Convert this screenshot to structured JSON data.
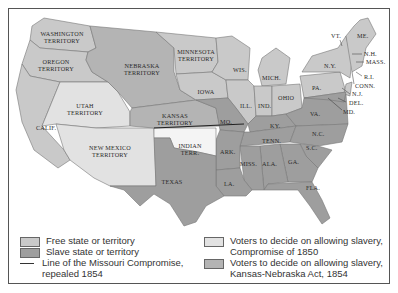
{
  "map": {
    "colors": {
      "free": "#c9c9c9",
      "slave": "#9e9e9e",
      "compromise_1850": "#e2e2e2",
      "kansas_nebraska": "#b4b4b4",
      "indian": "#f4f4f4",
      "water": "#ffffff",
      "missouri_line": "#222222"
    },
    "labels": {
      "washington": [
        "WASHINGTON",
        "TERRITORY"
      ],
      "oregon": [
        "OREGON",
        "TERRITORY"
      ],
      "nebraska": [
        "NEBRASKA",
        "TERRITORY"
      ],
      "minnesota": [
        "MINNESOTA",
        "TERRITORY"
      ],
      "utah": [
        "UTAH",
        "TERRITORY"
      ],
      "kansas": [
        "KANSAS",
        "TERRITORY"
      ],
      "new_mexico": [
        "NEW MEXICO",
        "TERRITORY"
      ],
      "indian": [
        "INDIAN",
        "TERR."
      ],
      "calif": "CALIF.",
      "texas": "TEXAS",
      "wis": "WIS.",
      "mich": "MICH.",
      "iowa": "IOWA",
      "ill": "ILL.",
      "ind": "IND.",
      "ohio": "OHIO",
      "mo": "MO.",
      "ky": "KY.",
      "tenn": "TENN.",
      "ark": "ARK.",
      "la": "LA.",
      "miss": "MISS.",
      "ala": "ALA.",
      "ga": "GA.",
      "fla": "FLA.",
      "sc": "S.C.",
      "nc": "N.C.",
      "va": "VA.",
      "pa": "PA.",
      "ny": "N.Y.",
      "vt": "VT.",
      "me": "ME.",
      "nh": "N.H.",
      "mass": "MASS.",
      "ri": "R.I.",
      "conn": "CONN.",
      "nj": "N.J.",
      "del": "DEL.",
      "md": "MD."
    }
  },
  "legend": {
    "items": [
      {
        "label": "Free state or territory",
        "type": "free"
      },
      {
        "label": "Slave state or territory",
        "type": "slave"
      },
      {
        "label_line1": "Line of the Missouri Compromise,",
        "label_line2": "repealed 1854",
        "type": "line"
      },
      {
        "label_line1": "Voters to decide on allowing slavery,",
        "label_line2": "Compromise of 1850",
        "type": "compromise_1850"
      },
      {
        "label_line1": "Voters to decide on allowing slavery,",
        "label_line2": "Kansas-Nebraska Act, 1854",
        "type": "kansas_nebraska"
      }
    ]
  }
}
